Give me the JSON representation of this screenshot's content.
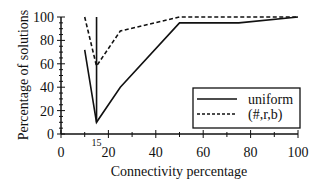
{
  "chart_data": {
    "type": "line",
    "title": "",
    "xlabel": "Connectivity percentage",
    "ylabel": "Percentage of solutions",
    "xlim": [
      0,
      100
    ],
    "ylim": [
      0,
      100
    ],
    "x_ticks": [
      0,
      20,
      40,
      60,
      80,
      100
    ],
    "y_ticks": [
      0,
      20,
      40,
      60,
      80,
      100
    ],
    "annotations": [
      {
        "text": "15",
        "x": 15,
        "y": 0
      }
    ],
    "grid": false,
    "legend_position": "lower right",
    "series": [
      {
        "name": "uniform",
        "style": "solid",
        "points": [
          [
            10,
            72
          ],
          [
            15,
            10
          ],
          [
            25,
            40
          ],
          [
            50,
            95
          ],
          [
            75,
            95
          ],
          [
            100,
            100
          ]
        ],
        "vertical_marker": {
          "x": 15,
          "y_from": 10,
          "y_to": 100
        }
      },
      {
        "name": "(#,r,b)",
        "style": "dashed",
        "points": [
          [
            10,
            100
          ],
          [
            15,
            58
          ],
          [
            25,
            88
          ],
          [
            50,
            100
          ],
          [
            100,
            100
          ]
        ]
      }
    ]
  },
  "legend": {
    "items": [
      {
        "label": "uniform",
        "style": "solid"
      },
      {
        "label": "(#,r,b)",
        "style": "dashed"
      }
    ]
  },
  "colors": {
    "line": "#111111",
    "background": "#ffffff"
  }
}
